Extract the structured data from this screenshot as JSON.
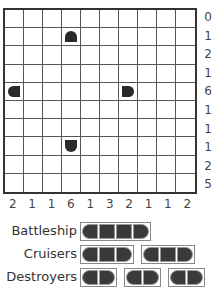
{
  "puzzle": {
    "rows": 10,
    "cols": 10,
    "row_clues": [
      "0",
      "1",
      "2",
      "1",
      "6",
      "1",
      "1",
      "1",
      "2",
      "5"
    ],
    "col_clues": [
      "2",
      "1",
      "1",
      "6",
      "1",
      "3",
      "2",
      "1",
      "1",
      "2"
    ],
    "revealed_segments": [
      {
        "row": 1,
        "col": 3,
        "shape": "top"
      },
      {
        "row": 4,
        "col": 0,
        "shape": "left"
      },
      {
        "row": 4,
        "col": 6,
        "shape": "right"
      },
      {
        "row": 7,
        "col": 3,
        "shape": "bottom"
      }
    ]
  },
  "legend": {
    "battleship": {
      "label": "Battleship",
      "fleet": [
        4
      ]
    },
    "cruisers": {
      "label": "Cruisers",
      "fleet": [
        3,
        3
      ]
    },
    "destroyers": {
      "label": "Destroyers",
      "fleet": [
        2,
        2,
        2
      ]
    }
  },
  "colors": {
    "ship": "#2a2a2a",
    "grid": "#333333"
  }
}
